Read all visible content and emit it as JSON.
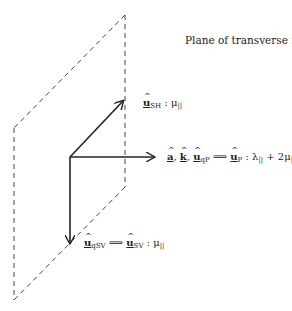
{
  "title": "Plane of transverse isotropy",
  "labels": {
    "sh": {
      "vec": "u",
      "sub": "SH",
      "rest": " : μ",
      "rest_sub": "||"
    },
    "p": {
      "a": "a",
      "k": "k",
      "u": "u",
      "u_sub": "qP",
      "arrow": " ⟹ ",
      "up": "u",
      "up_sub": "P",
      "rest": " : λ",
      "rest_sub": "||",
      "tail": " + 2μ",
      "tail_sub": "||"
    },
    "sv": {
      "vec": "u",
      "sub": "qSV",
      "arrow": " ⟹ ",
      "vec2": "u",
      "sub2": "SV",
      "rest": " : μ",
      "rest_sub": "||"
    }
  },
  "colors": {
    "line": "#222222",
    "dash": "#444444"
  }
}
